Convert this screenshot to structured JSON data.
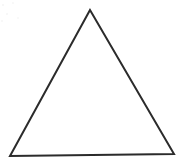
{
  "figure": {
    "name": "triangle",
    "shape_label": "triangle",
    "background_color": "#ffffff",
    "stroke_color": "#2b2b2b",
    "stroke_width": 2,
    "fill": "none",
    "canvas": {
      "width": 184,
      "height": 165
    },
    "vertices": [
      {
        "name": "apex",
        "x": 90,
        "y": 10
      },
      {
        "name": "bottom-left",
        "x": 10,
        "y": 156
      },
      {
        "name": "bottom-right",
        "x": 174,
        "y": 154
      }
    ],
    "edges": [
      {
        "name": "left-edge",
        "from": "apex",
        "to": "bottom-left"
      },
      {
        "name": "base-edge",
        "from": "bottom-left",
        "to": "bottom-right"
      },
      {
        "name": "right-edge",
        "from": "bottom-right",
        "to": "apex"
      }
    ],
    "polygon_points": "90,10 10,156 174,154"
  }
}
